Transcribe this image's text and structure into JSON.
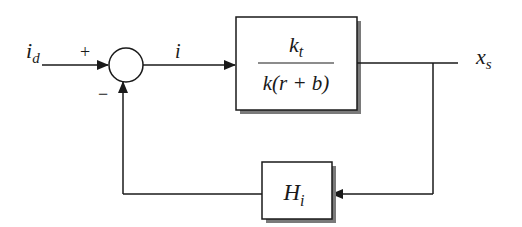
{
  "diagram": {
    "type": "block-diagram",
    "input": {
      "symbol": "i",
      "subscript": "d"
    },
    "summing_junction": {
      "plus_sign": "+",
      "minus_sign": "−"
    },
    "error_signal": {
      "symbol": "i"
    },
    "forward_block": {
      "numerator": {
        "symbol": "k",
        "subscript": "t"
      },
      "denominator": "k(r + b)"
    },
    "output": {
      "symbol": "x",
      "subscript": "s"
    },
    "feedback_block": {
      "symbol": "H",
      "subscript": "i"
    }
  },
  "colors": {
    "line": "#1a1a1a",
    "shadow": "#7a7a7a",
    "background": "#ffffff"
  }
}
